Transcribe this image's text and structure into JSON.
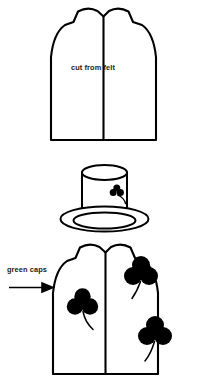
{
  "figure": {
    "background_color": "#ffffff",
    "ink_color": "#000000",
    "panels": [
      {
        "id": "panel-plain-vest",
        "name": "plain-vest-pattern",
        "caption": "cut from felt",
        "description": "Front view of a sleeveless vest pattern with center front opening line"
      },
      {
        "id": "panel-hat",
        "name": "hat-with-shamrock",
        "caption": "",
        "description": "Cylindrical hat crown with oval brim and a small shamrock on the band"
      },
      {
        "id": "panel-decorated-vest",
        "name": "decorated-vest",
        "caption": "green caps",
        "description": "Vest decorated with three filled shamrocks, arrow pointing to it"
      }
    ]
  },
  "captions": {
    "cut_from_felt": "cut from felt",
    "green_caps": "green caps"
  },
  "icons": {
    "arrow": "right-arrow-icon",
    "shamrock": "shamrock-icon",
    "hat": "hat-icon"
  },
  "shamrocks": [
    {
      "id": "hat-shamrock",
      "size": "small",
      "location": "hat band"
    },
    {
      "id": "vest-shamrock-left",
      "size": "medium",
      "location": "vest left front"
    },
    {
      "id": "vest-shamrock-upper-right",
      "size": "large",
      "location": "vest upper right front"
    },
    {
      "id": "vest-shamrock-lower-right",
      "size": "large",
      "location": "vest lower right front"
    }
  ]
}
